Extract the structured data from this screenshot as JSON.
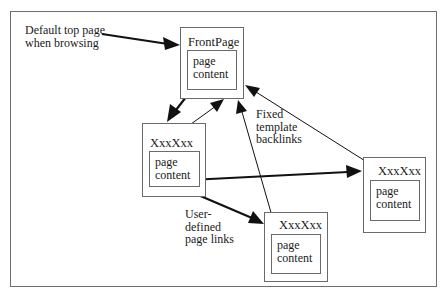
{
  "diagram": {
    "annotations": {
      "default_top_page": "Default top page\nwhen browsing",
      "fixed_backlinks": "Fixed\ntemplate\nbacklinks",
      "user_links": "User-\ndefined\npage links"
    },
    "pages": {
      "front": {
        "title": "FrontPage",
        "content": "page\ncontent"
      },
      "left": {
        "title": "XxxXxx",
        "content": "page\ncontent"
      },
      "right": {
        "title": "XxxXxx",
        "content": "page\ncontent"
      },
      "bottom": {
        "title": "XxxXxx",
        "content": "page\ncontent"
      }
    },
    "edges": [
      {
        "from": "default_top_page_label",
        "to": "FrontPage",
        "type": "entry"
      },
      {
        "from": "FrontPage.content",
        "to": "left XxxXxx",
        "type": "user-defined page link"
      },
      {
        "from": "left XxxXxx.content",
        "to": "right XxxXxx",
        "type": "user-defined page link"
      },
      {
        "from": "left XxxXxx.content",
        "to": "bottom XxxXxx",
        "type": "user-defined page link"
      },
      {
        "from": "left XxxXxx",
        "to": "FrontPage",
        "type": "fixed template backlink"
      },
      {
        "from": "bottom XxxXxx",
        "to": "FrontPage",
        "type": "fixed template backlink"
      },
      {
        "from": "right XxxXxx",
        "to": "FrontPage",
        "type": "fixed template backlink"
      }
    ],
    "colors": {
      "line": "#1a1a1a",
      "box_border": "#6a6a6a",
      "background": "#ffffff"
    }
  }
}
